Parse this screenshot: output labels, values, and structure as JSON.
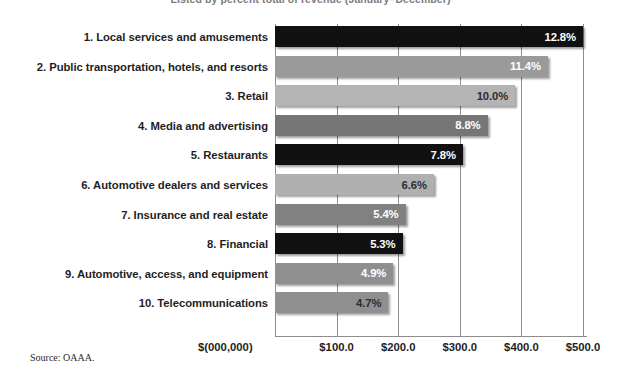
{
  "chart_data": {
    "type": "bar",
    "orientation": "horizontal",
    "title": "Listed by percent total of revenue (January–December)",
    "xlabel": "$(000,000)",
    "ylabel": "",
    "categories": [
      "1. Local services and amusements",
      "2. Public transportation, hotels, and resorts",
      "3. Retail",
      "4. Media and advertising",
      "5. Restaurants",
      "6. Automotive dealers and services",
      "7. Insurance and real estate",
      "8. Financial",
      "9. Automotive, access, and equipment",
      "10. Telecommunications"
    ],
    "values": [
      12.8,
      11.4,
      10.0,
      8.8,
      7.8,
      6.6,
      5.4,
      5.3,
      4.9,
      4.7
    ],
    "value_labels": [
      "12.8%",
      "11.4%",
      "10.0%",
      "8.8%",
      "7.8%",
      "6.6%",
      "5.4%",
      "5.3%",
      "4.9%",
      "4.7%"
    ],
    "bar_dollars": [
      500.0,
      443.0,
      390.0,
      345.0,
      305.0,
      258.0,
      212.0,
      207.0,
      192.0,
      184.0
    ],
    "bar_colors": [
      "#111111",
      "#9a9a9a",
      "#b4b4b4",
      "#767676",
      "#111111",
      "#b0b0b0",
      "#818181",
      "#111111",
      "#8f8f8f",
      "#8f8f8f"
    ],
    "bar_label_colors": [
      "#ffffff",
      "#ffffff",
      "#2b2b2b",
      "#ffffff",
      "#ffffff",
      "#2e2e2e",
      "#ffffff",
      "#ffffff",
      "#ffffff",
      "#2e2e2e"
    ],
    "xticks": [
      0,
      100,
      200,
      300,
      400,
      500
    ],
    "xtick_labels": [
      "$(000,000)",
      "$100.0",
      "$200.0",
      "$300.0",
      "$400.0",
      "$500.0"
    ],
    "xlim": [
      0,
      500
    ],
    "grid": true,
    "legend": "none",
    "source": "Source: OAAA."
  }
}
